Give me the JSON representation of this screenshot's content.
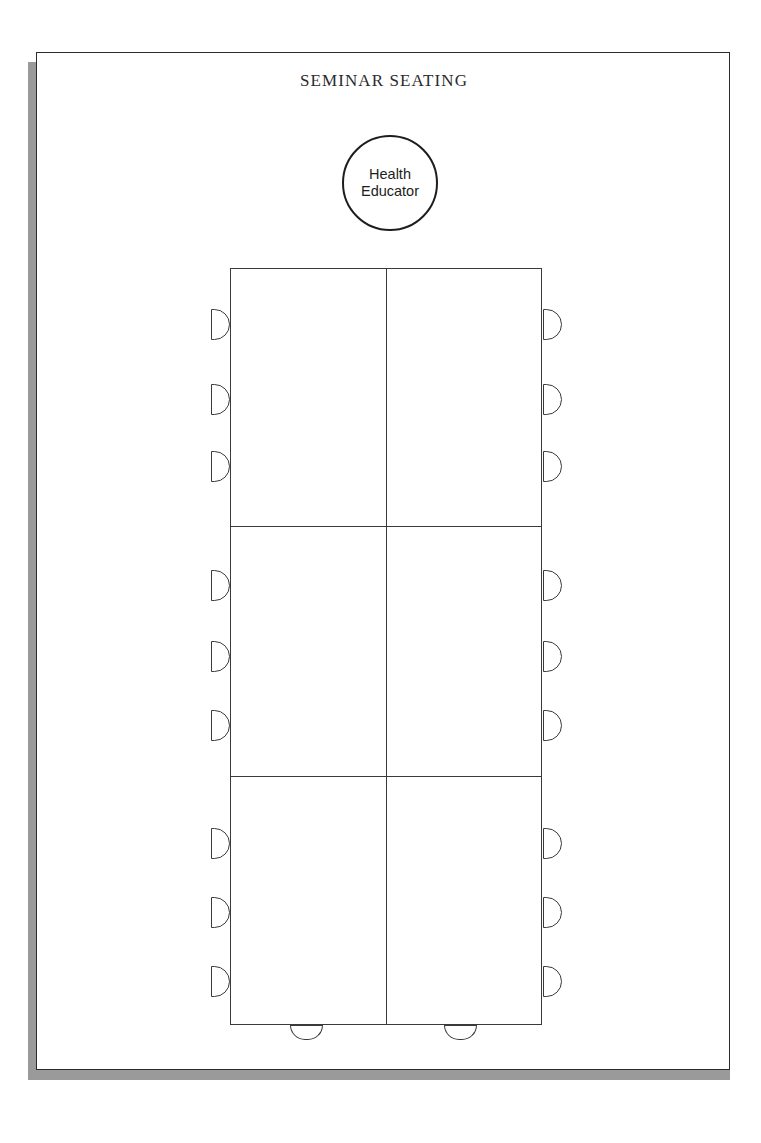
{
  "document": {
    "title": "SEMINAR SEATING",
    "page_background": "#ffffff",
    "sheet_border_color": "#2b2b2b",
    "shadow_color": "#9a9a9a",
    "ink_color": "#3a3a3a"
  },
  "presenter": {
    "label": "Health\nEducator",
    "shape": "circle",
    "diameter_px": 96,
    "center": {
      "x": 389,
      "y": 182
    }
  },
  "table": {
    "shape": "rectangular-block",
    "columns": 2,
    "rows": 3,
    "bounds": {
      "left": 229,
      "top": 267,
      "right": 541,
      "bottom": 1024
    },
    "horizontal_divider_y": [
      525,
      775
    ],
    "vertical_divider_x": [
      385
    ]
  },
  "seating": {
    "total_seats": 20,
    "left_seats": 9,
    "right_seats": 9,
    "bottom_seats": 2,
    "left_chairs": [
      {
        "name": "left-seat-1",
        "top": 41,
        "group": 1
      },
      {
        "name": "left-seat-2",
        "top": 116,
        "group": 1
      },
      {
        "name": "left-seat-3",
        "top": 183,
        "group": 1
      },
      {
        "name": "left-seat-4",
        "top": 302,
        "group": 2
      },
      {
        "name": "left-seat-5",
        "top": 373,
        "group": 2
      },
      {
        "name": "left-seat-6",
        "top": 442,
        "group": 2
      },
      {
        "name": "left-seat-7",
        "top": 560,
        "group": 3
      },
      {
        "name": "left-seat-8",
        "top": 629,
        "group": 3
      },
      {
        "name": "left-seat-9",
        "top": 698,
        "group": 3
      }
    ],
    "right_chairs": [
      {
        "name": "right-seat-1",
        "top": 41,
        "group": 1
      },
      {
        "name": "right-seat-2",
        "top": 116,
        "group": 1
      },
      {
        "name": "right-seat-3",
        "top": 183,
        "group": 1
      },
      {
        "name": "right-seat-4",
        "top": 302,
        "group": 2
      },
      {
        "name": "right-seat-5",
        "top": 373,
        "group": 2
      },
      {
        "name": "right-seat-6",
        "top": 442,
        "group": 2
      },
      {
        "name": "right-seat-7",
        "top": 560,
        "group": 3
      },
      {
        "name": "right-seat-8",
        "top": 629,
        "group": 3
      },
      {
        "name": "right-seat-9",
        "top": 698,
        "group": 3
      }
    ],
    "bottom_chairs": [
      {
        "name": "bottom-seat-1",
        "left": 76
      },
      {
        "name": "bottom-seat-2",
        "left": 230
      }
    ]
  }
}
